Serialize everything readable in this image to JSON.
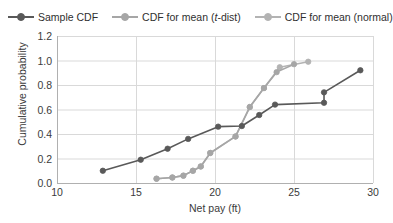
{
  "legend": {
    "position": "top-left",
    "entries": [
      {
        "label": "Sample CDF",
        "color": "#595959",
        "marker": "circle",
        "italic_part": ""
      },
      {
        "label": "CDF for mean (t-dist)",
        "color": "#a6a6a6",
        "marker": "circle",
        "italic_part": "t"
      },
      {
        "label": "CDF for mean (normal)",
        "color": "#b3b3b3",
        "marker": "circle",
        "italic_part": ""
      }
    ]
  },
  "axes": {
    "x_label": "Net pay (ft)",
    "y_label": "Cumulative probability",
    "x_ticks": [
      "10",
      "15",
      "20",
      "25",
      "30"
    ],
    "y_ticks": [
      "0.0",
      "0.2",
      "0.4",
      "0.6",
      "0.8",
      "1.0",
      "1.2"
    ],
    "x_min": 10,
    "x_max": 30,
    "y_min": 0.0,
    "y_max": 1.2,
    "grid": "horizontal-and-vertical",
    "grid_color": "#d9d9d9"
  },
  "chart_data": {
    "type": "line",
    "title": "",
    "subtitle": "",
    "xlabel": "Net pay (ft)",
    "ylabel": "Cumulative probability",
    "xlim": [
      10,
      30
    ],
    "ylim": [
      0.0,
      1.2
    ],
    "grid": true,
    "legend_position": "top-left",
    "series": [
      {
        "name": "Sample CDF",
        "color": "#595959",
        "marker": "circle",
        "points": [
          [
            12.9,
            0.1
          ],
          [
            15.3,
            0.19
          ],
          [
            17.0,
            0.28
          ],
          [
            18.3,
            0.36
          ],
          [
            20.2,
            0.46
          ],
          [
            21.7,
            0.465
          ],
          [
            22.8,
            0.555
          ],
          [
            23.8,
            0.64
          ],
          [
            26.9,
            0.655
          ],
          [
            26.9,
            0.74
          ],
          [
            29.2,
            0.92
          ]
        ]
      },
      {
        "name": "CDF for mean (t-dist)",
        "color": "#a6a6a6",
        "marker": "circle",
        "points": [
          [
            16.3,
            0.035
          ],
          [
            17.3,
            0.045
          ],
          [
            18.0,
            0.06
          ],
          [
            18.6,
            0.1
          ],
          [
            19.1,
            0.135
          ],
          [
            19.7,
            0.245
          ],
          [
            21.3,
            0.38
          ],
          [
            22.2,
            0.62
          ],
          [
            23.1,
            0.775
          ],
          [
            23.9,
            0.905
          ],
          [
            25.0,
            0.97
          ]
        ]
      },
      {
        "name": "CDF for mean (normal)",
        "color": "#b3b3b3",
        "marker": "circle",
        "points": [
          [
            16.3,
            0.035
          ],
          [
            17.3,
            0.045
          ],
          [
            18.0,
            0.06
          ],
          [
            18.6,
            0.1
          ],
          [
            19.1,
            0.135
          ],
          [
            19.7,
            0.245
          ],
          [
            21.3,
            0.38
          ],
          [
            22.2,
            0.62
          ],
          [
            23.1,
            0.775
          ],
          [
            24.1,
            0.945
          ],
          [
            25.9,
            0.99
          ]
        ]
      }
    ]
  }
}
